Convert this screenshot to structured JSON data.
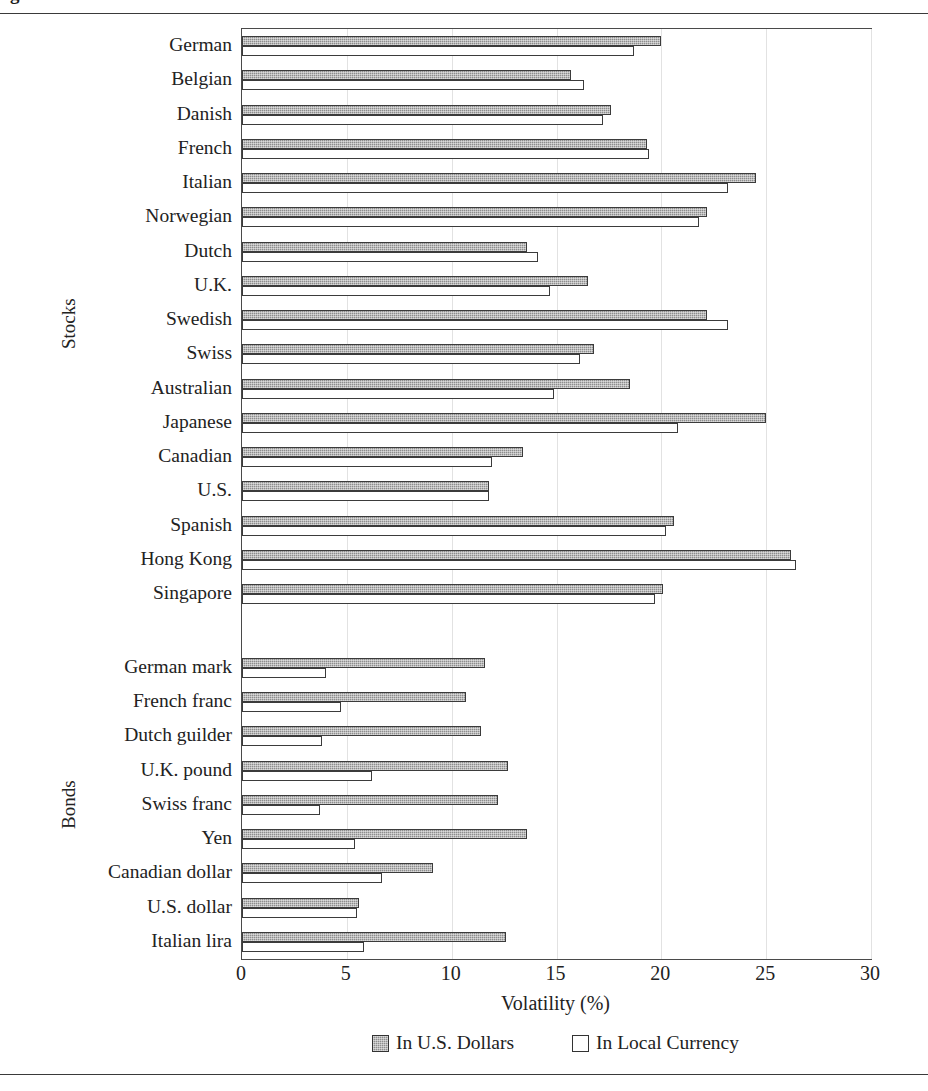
{
  "figure": {
    "title_partial": "g",
    "top_rule": true,
    "bottom_rule": true
  },
  "axis": {
    "x_title": "Volatility (%)",
    "x_ticks": [
      0,
      5,
      10,
      15,
      20,
      25,
      30
    ],
    "x_tick_labels": [
      "0",
      "5",
      "10",
      "15",
      "20",
      "25",
      "30"
    ]
  },
  "groups": [
    {
      "name": "Stocks",
      "label": "Stocks"
    },
    {
      "name": "Bonds",
      "label": "Bonds"
    }
  ],
  "legend": {
    "position": "bottom-center",
    "entries": [
      {
        "label": "In U.S. Dollars",
        "swatch": "usd",
        "color": "#8d8d8d"
      },
      {
        "label": "In Local Currency",
        "swatch": "local",
        "color": "#ffffff"
      }
    ]
  },
  "chart_data": {
    "type": "bar",
    "orientation": "horizontal",
    "title": "",
    "xlabel": "Volatility (%)",
    "ylabel": "",
    "xlim": [
      0,
      30
    ],
    "grid": true,
    "grid_axis": "x",
    "legend_position": "bottom-center",
    "categories": [
      "German",
      "Belgian",
      "Danish",
      "French",
      "Italian",
      "Norwegian",
      "Dutch",
      "U.K.",
      "Swedish",
      "Swiss",
      "Australian",
      "Japanese",
      "Canadian",
      "U.S.",
      "Spanish",
      "Hong Kong",
      "Singapore",
      "German mark",
      "French franc",
      "Dutch guilder",
      "U.K. pound",
      "Swiss franc",
      "Yen",
      "Canadian dollar",
      "U.S. dollar",
      "Italian lira"
    ],
    "group_of_category": [
      "Stocks",
      "Stocks",
      "Stocks",
      "Stocks",
      "Stocks",
      "Stocks",
      "Stocks",
      "Stocks",
      "Stocks",
      "Stocks",
      "Stocks",
      "Stocks",
      "Stocks",
      "Stocks",
      "Stocks",
      "Stocks",
      "Stocks",
      "Bonds",
      "Bonds",
      "Bonds",
      "Bonds",
      "Bonds",
      "Bonds",
      "Bonds",
      "Bonds",
      "Bonds"
    ],
    "series": [
      {
        "name": "In U.S. Dollars",
        "color": "#8d8d8d",
        "values": [
          20.0,
          15.7,
          17.6,
          19.3,
          24.5,
          22.2,
          13.6,
          16.5,
          22.2,
          16.8,
          18.5,
          25.0,
          13.4,
          11.8,
          20.6,
          26.2,
          20.1,
          11.6,
          10.7,
          11.4,
          12.7,
          12.2,
          13.6,
          9.1,
          5.6,
          12.6
        ]
      },
      {
        "name": "In Local Currency",
        "color": "#ffffff",
        "values": [
          18.7,
          16.3,
          17.2,
          19.4,
          23.2,
          21.8,
          14.1,
          14.7,
          23.2,
          16.1,
          14.9,
          20.8,
          11.9,
          11.8,
          20.2,
          26.4,
          19.7,
          4.0,
          4.7,
          3.8,
          6.2,
          3.7,
          5.4,
          6.7,
          5.5,
          5.8
        ]
      }
    ]
  }
}
